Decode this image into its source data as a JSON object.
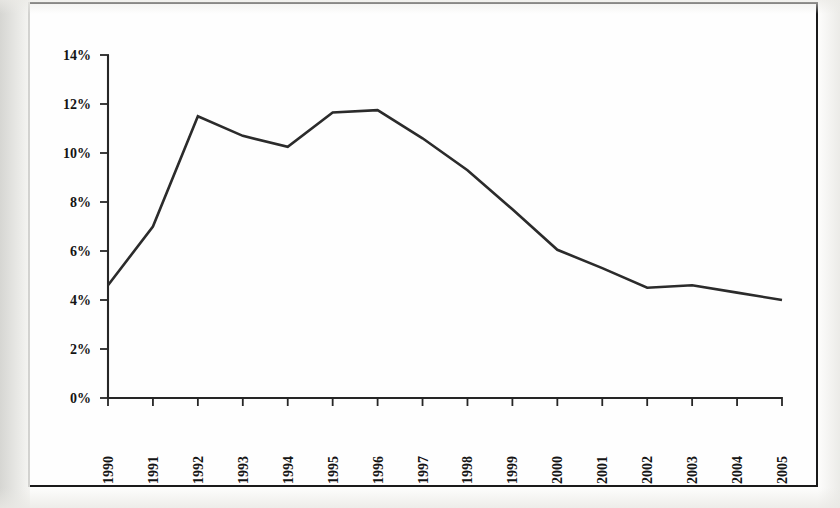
{
  "chart_data": {
    "type": "line",
    "title": "",
    "subtitle": "",
    "xlabel": "",
    "ylabel": "",
    "categories": [
      "1990",
      "1991",
      "1992",
      "1993",
      "1994",
      "1995",
      "1996",
      "1997",
      "1998",
      "1999",
      "2000",
      "2001",
      "2002",
      "2003",
      "2004",
      "2005"
    ],
    "values": [
      4.6,
      7.0,
      11.5,
      10.7,
      10.25,
      11.65,
      11.75,
      10.6,
      9.3,
      7.7,
      6.05,
      5.3,
      4.5,
      4.6,
      4.3,
      4.0
    ],
    "ylim": [
      0,
      14
    ],
    "ytick_values": [
      0,
      2,
      4,
      6,
      8,
      10,
      12,
      14
    ],
    "ytick_labels": [
      "0%",
      "2%",
      "4%",
      "6%",
      "8%",
      "10%",
      "12%",
      "14%"
    ],
    "xtick_labels": [
      "1990",
      "1991",
      "1992",
      "1993",
      "1994",
      "1995",
      "1996",
      "1997",
      "1998",
      "1999",
      "2000",
      "2001",
      "2002",
      "2003",
      "2004",
      "2005"
    ],
    "xtick_rotation": 90,
    "grid": false,
    "legend": null,
    "legend_position": "none",
    "series_color": "#2b2b2b",
    "axis_color": "#262626",
    "annotations": []
  },
  "figure": {
    "border_color": "#1a1a1a",
    "background_color": "#fefefe"
  }
}
